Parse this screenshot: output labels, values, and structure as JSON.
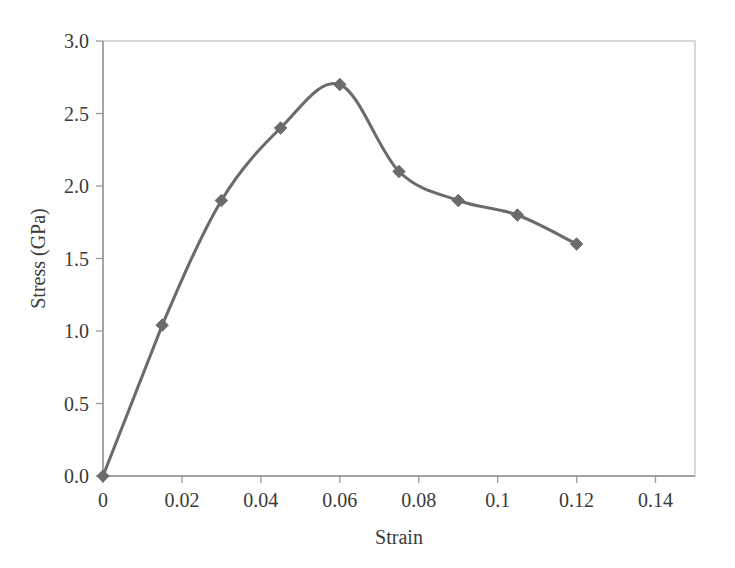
{
  "chart_data": {
    "type": "line",
    "title": "",
    "xlabel": "Strain",
    "ylabel": "Stress (GPa)",
    "xlim": [
      0,
      0.15
    ],
    "ylim": [
      0,
      3.0
    ],
    "grid": false,
    "legend": false,
    "legend_position": "none",
    "marker": "diamond",
    "series_color": "#6b6b6b",
    "x": [
      0,
      0.015,
      0.03,
      0.045,
      0.06,
      0.075,
      0.09,
      0.105,
      0.12
    ],
    "values": [
      0.0,
      1.04,
      1.9,
      2.4,
      2.7,
      2.1,
      1.9,
      1.8,
      1.6
    ],
    "series": [
      {
        "name": "Stress-strain curve",
        "x": [
          0,
          0.015,
          0.03,
          0.045,
          0.06,
          0.075,
          0.09,
          0.105,
          0.12
        ],
        "values": [
          0.0,
          1.04,
          1.9,
          2.4,
          2.7,
          2.1,
          1.9,
          1.8,
          1.6
        ]
      }
    ],
    "x_ticks": [
      0,
      0.02,
      0.04,
      0.06,
      0.08,
      0.1,
      0.12,
      0.14
    ],
    "x_tick_labels": [
      "0",
      "0.02",
      "0.04",
      "0.06",
      "0.08",
      "0.1",
      "0.12",
      "0.14"
    ],
    "y_ticks": [
      0.0,
      0.5,
      1.0,
      1.5,
      2.0,
      2.5,
      3.0
    ],
    "y_tick_labels": [
      "0.0",
      "0.5",
      "1.0",
      "1.5",
      "2.0",
      "2.5",
      "3.0"
    ]
  },
  "colors": {
    "background": "#ffffff",
    "series": "#6b6b6b",
    "axis": "#8f8f8f",
    "frame": "#c9c9c9",
    "text": "#3a3a3a"
  }
}
